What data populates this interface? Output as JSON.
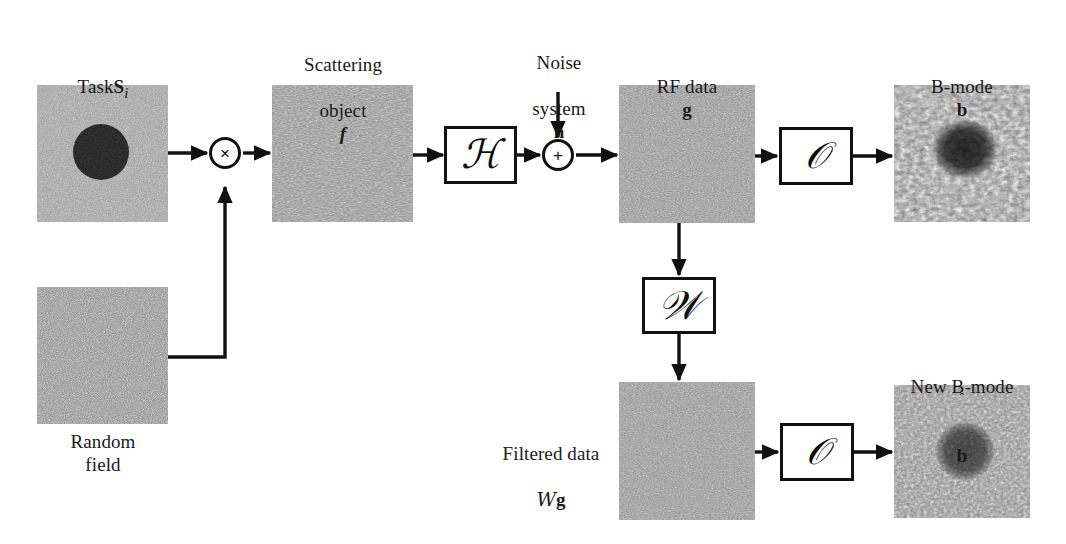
{
  "figure": {
    "type": "block-diagram",
    "background_color": "#ffffff",
    "line_color": "#111111"
  },
  "blocks": [
    {
      "id": "task",
      "name": "task-image-block",
      "label_line1": "Task ",
      "label_symbol": "S",
      "label_subscript": "i",
      "x": 37,
      "y": 85,
      "w": 131,
      "h": 137,
      "texture": "speckle-gray",
      "base_gray": "#9a9a9a",
      "has_lesion": true,
      "lesion": {
        "cx": 0.49,
        "cy": 0.49,
        "r": 0.205,
        "color": "#1d1d1d"
      }
    },
    {
      "id": "random_field",
      "name": "random-field-block",
      "label": "Random\nfield",
      "x": 37,
      "y": 287,
      "w": 131,
      "h": 137,
      "texture": "speckle-fine",
      "base_gray": "#8e8e8e",
      "has_lesion": false
    },
    {
      "id": "scattering_object",
      "name": "scattering-object-block",
      "label_line1": "Scattering",
      "label_line2": "object ",
      "label_symbol": "f",
      "x": 272,
      "y": 85,
      "w": 141,
      "h": 137,
      "texture": "speckle-coarse",
      "base_gray": "#909090",
      "has_lesion": false
    },
    {
      "id": "rf_data",
      "name": "rf-data-block",
      "label_line1": "RF data ",
      "label_symbol": "g",
      "x": 619,
      "y": 85,
      "w": 136,
      "h": 138,
      "texture": "speckle-gray",
      "base_gray": "#8d8d8d",
      "has_lesion": false
    },
    {
      "id": "bmode",
      "name": "b-mode-image-block",
      "label_line1": "B-mode ",
      "label_symbol": "b",
      "x": 894,
      "y": 85,
      "w": 136,
      "h": 137,
      "texture": "speckle-bmode",
      "base_gray": "#8a8a8a",
      "has_lesion": true,
      "lesion": {
        "cx": 0.52,
        "cy": 0.47,
        "r": 0.23,
        "color": "#2c2c2c"
      }
    },
    {
      "id": "filtered_data",
      "name": "filtered-data-block",
      "label_line1": "Filtered data",
      "label_line2_script": "W",
      "label_line2_symbol": "g",
      "x": 619,
      "y": 382,
      "w": 136,
      "h": 138,
      "texture": "speckle-gray",
      "base_gray": "#8f8f8f",
      "has_lesion": false
    },
    {
      "id": "new_bmode",
      "name": "new-b-mode-image-block",
      "label_line1": "New B-mode ",
      "label_symbol": "b",
      "label_accent": "hat",
      "x": 894,
      "y": 385,
      "w": 136,
      "h": 133,
      "texture": "speckle-bmode2",
      "base_gray": "#8c8c8c",
      "has_lesion": true,
      "lesion": {
        "cx": 0.52,
        "cy": 0.5,
        "r": 0.215,
        "color": "#3a3a3a"
      }
    }
  ],
  "operators": [
    {
      "id": "system_H",
      "name": "system-operator-box",
      "glyph": "ℋ",
      "meaning": "imaging-system-operator",
      "x": 444,
      "y": 126,
      "w": 73,
      "h": 58
    },
    {
      "id": "envelope_O_top",
      "name": "envelope-operator-box-top",
      "glyph": "𝒪",
      "meaning": "envelope-detection-operator",
      "x": 779,
      "y": 127,
      "w": 74,
      "h": 58
    },
    {
      "id": "filter_W",
      "name": "wiener-filter-box",
      "glyph": "𝒲",
      "meaning": "wiener-filter-operator",
      "x": 642,
      "y": 277,
      "w": 74,
      "h": 57
    },
    {
      "id": "envelope_O_bottom",
      "name": "envelope-operator-box-bottom",
      "glyph": "𝒪",
      "meaning": "envelope-detection-operator",
      "x": 780,
      "y": 423,
      "w": 74,
      "h": 58
    }
  ],
  "junctions": [
    {
      "id": "multiply",
      "name": "multiply-junction",
      "symbol": "×",
      "cx": 225,
      "cy": 153,
      "r": 16
    },
    {
      "id": "add",
      "name": "add-junction",
      "symbol": "+",
      "cx": 558,
      "cy": 155,
      "r": 16
    }
  ],
  "annotations": [
    {
      "id": "noise_label",
      "name": "noise-system-label",
      "line1": "Noise",
      "line2": "system ",
      "symbol": "n",
      "x": 496,
      "y": 28,
      "w": 126
    }
  ],
  "labels": {
    "task": "Task",
    "task_symbol": "S",
    "task_sub": "i",
    "random_field": "Random\nfield",
    "scattering_line1": "Scattering",
    "scattering_line2": "object",
    "scattering_symbol": "f",
    "noise_line1": "Noise",
    "noise_line2": "system",
    "noise_symbol": "n",
    "rf_data": "RF data",
    "rf_symbol": "g",
    "bmode": "B-mode",
    "bmode_symbol": "b",
    "filtered_line1": "Filtered data",
    "filtered_script": "W",
    "filtered_symbol": "g",
    "new_bmode": "New B-mode",
    "new_bmode_symbol": "b",
    "op_H": "ℋ",
    "op_O": "𝒪",
    "op_W": "𝒲",
    "multiply_symbol": "×",
    "add_symbol": "+"
  },
  "flow": {
    "description": "Task S_i multiplied by Random field yields Scattering object f; f passes through system operator H, noise n is added at summing junction producing RF data g; g through envelope operator O yields B-mode b; g also passes through Wiener filter W producing Filtered data Wg, which through O yields New B-mode b-hat.",
    "edges": [
      {
        "from": "task",
        "to": "multiply",
        "name": "edge-task-to-multiply"
      },
      {
        "from": "random_field",
        "to": "multiply",
        "name": "edge-random-field-to-multiply"
      },
      {
        "from": "multiply",
        "to": "scattering_object",
        "name": "edge-multiply-to-scattering"
      },
      {
        "from": "scattering_object",
        "to": "system_H",
        "name": "edge-scattering-to-system"
      },
      {
        "from": "system_H",
        "to": "add",
        "name": "edge-system-to-add"
      },
      {
        "from": "noise_label",
        "to": "add",
        "name": "edge-noise-to-add"
      },
      {
        "from": "add",
        "to": "rf_data",
        "name": "edge-add-to-rf-data"
      },
      {
        "from": "rf_data",
        "to": "envelope_O_top",
        "name": "edge-rf-to-envelope-top"
      },
      {
        "from": "envelope_O_top",
        "to": "bmode",
        "name": "edge-envelope-to-bmode"
      },
      {
        "from": "rf_data",
        "to": "filter_W",
        "name": "edge-rf-to-wiener"
      },
      {
        "from": "filter_W",
        "to": "filtered_data",
        "name": "edge-wiener-to-filtered"
      },
      {
        "from": "filtered_data",
        "to": "envelope_O_bottom",
        "name": "edge-filtered-to-envelope-bottom"
      },
      {
        "from": "envelope_O_bottom",
        "to": "new_bmode",
        "name": "edge-envelope-to-new-bmode"
      }
    ]
  }
}
